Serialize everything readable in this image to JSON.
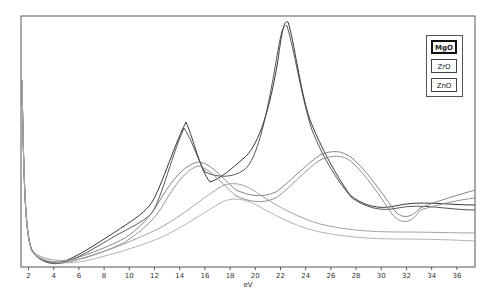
{
  "chart_data": {
    "type": "line",
    "title": "",
    "xlabel": "eV",
    "ylabel": "",
    "xlim": [
      1.5,
      37.5
    ],
    "x_ticks": [
      2,
      4,
      6,
      8,
      10,
      12,
      14,
      16,
      18,
      20,
      22,
      24,
      26,
      28,
      30,
      32,
      34,
      36
    ],
    "grid": false,
    "legend_position": "top-right",
    "legend": [
      "MgO",
      "ZrO",
      "ZnO"
    ],
    "series": [
      {
        "name": "MgO",
        "x": [
          1.6,
          2,
          3,
          4,
          6,
          8,
          10,
          12,
          13,
          14,
          14.7,
          16,
          18,
          20,
          22,
          22.6,
          24,
          26,
          28,
          30,
          32,
          34,
          37
        ],
        "y": [
          0.92,
          0.22,
          0.08,
          0.05,
          0.06,
          0.1,
          0.16,
          0.26,
          0.36,
          0.52,
          0.62,
          0.4,
          0.42,
          0.56,
          0.88,
          0.98,
          0.78,
          0.5,
          0.3,
          0.22,
          0.24,
          0.23,
          0.22
        ]
      },
      {
        "name": "ZrO",
        "x": [
          1.6,
          2,
          3,
          4,
          6,
          8,
          10,
          12,
          14,
          16,
          18,
          20,
          22,
          24,
          26,
          27,
          28,
          30,
          32,
          34,
          37
        ],
        "y": [
          0.92,
          0.22,
          0.08,
          0.05,
          0.07,
          0.11,
          0.17,
          0.25,
          0.36,
          0.4,
          0.32,
          0.28,
          0.32,
          0.38,
          0.46,
          0.48,
          0.44,
          0.28,
          0.2,
          0.24,
          0.26
        ]
      },
      {
        "name": "ZnO",
        "x": [
          1.6,
          2,
          3,
          4,
          6,
          8,
          10,
          12,
          14,
          16,
          18,
          19,
          20,
          22,
          24,
          26,
          28,
          30,
          32,
          34,
          37
        ],
        "y": [
          0.92,
          0.22,
          0.08,
          0.05,
          0.06,
          0.08,
          0.12,
          0.18,
          0.24,
          0.3,
          0.34,
          0.36,
          0.34,
          0.28,
          0.22,
          0.16,
          0.12,
          0.1,
          0.09,
          0.09,
          0.09
        ]
      }
    ],
    "colors": {
      "frame": "#555555",
      "MgO": "#222222",
      "ZrO": "#666666",
      "ZnO": "#888888"
    }
  },
  "legend": {
    "items": [
      "MgO",
      "ZrO",
      "ZnO"
    ],
    "selected": "MgO"
  },
  "axis": {
    "xlabel": "eV",
    "ticks": [
      "2",
      "4",
      "6",
      "8",
      "10",
      "12",
      "14",
      "16",
      "18",
      "20",
      "22",
      "24",
      "26",
      "28",
      "30",
      "32",
      "34",
      "36"
    ]
  }
}
